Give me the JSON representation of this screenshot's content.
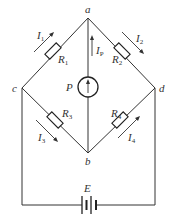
{
  "diagram": {
    "type": "wheatstone-bridge-circuit",
    "nodes": {
      "a": {
        "label": "a",
        "x": 88,
        "y": 18
      },
      "b": {
        "label": "b",
        "x": 88,
        "y": 153
      },
      "c": {
        "label": "c",
        "x": 22,
        "y": 88
      },
      "d": {
        "label": "d",
        "x": 155,
        "y": 88
      }
    },
    "resistors": [
      {
        "id": "R1",
        "label": "R",
        "sub": "1",
        "between": [
          "a",
          "c"
        ]
      },
      {
        "id": "R2",
        "label": "R",
        "sub": "2",
        "between": [
          "a",
          "d"
        ]
      },
      {
        "id": "R3",
        "label": "R",
        "sub": "3",
        "between": [
          "c",
          "b"
        ]
      },
      {
        "id": "R4",
        "label": "R",
        "sub": "4",
        "between": [
          "d",
          "b"
        ]
      }
    ],
    "currents": [
      {
        "id": "I1",
        "label": "I",
        "sub": "1",
        "direction": "c-to-a"
      },
      {
        "id": "I2",
        "label": "I",
        "sub": "2",
        "direction": "a-to-d"
      },
      {
        "id": "I3",
        "label": "I",
        "sub": "3",
        "direction": "c-to-b"
      },
      {
        "id": "I4",
        "label": "I",
        "sub": "4",
        "direction": "b-to-d"
      },
      {
        "id": "IP",
        "label": "I",
        "sub": "P",
        "direction": "b-to-a"
      }
    ],
    "meter": {
      "label": "P",
      "between": [
        "b",
        "a"
      ]
    },
    "source": {
      "label": "E",
      "type": "battery"
    }
  }
}
